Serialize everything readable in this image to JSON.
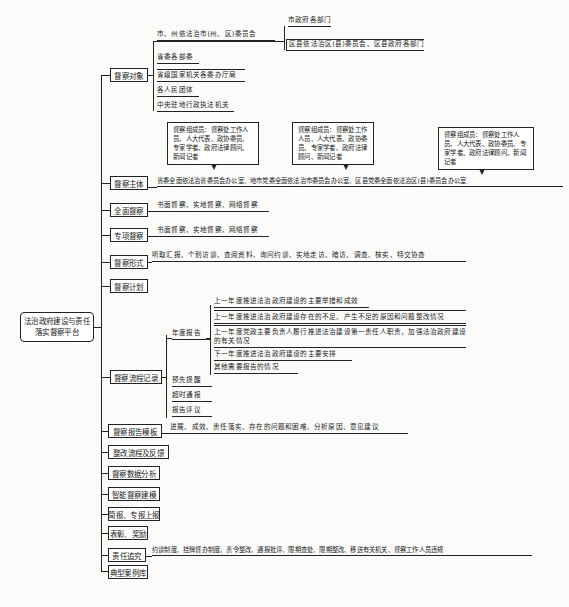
{
  "root": {
    "label": "法治政府建设与责任落实督察平台"
  },
  "branches": {
    "targets": {
      "label": "督察对象",
      "items": [
        {
          "label": "市、州依法治市(州、区)委员会",
          "children": [
            "市政府各部门",
            "区县依法治区(县)委员会、区县政府各部门"
          ]
        },
        {
          "label": "省委各部委"
        },
        {
          "label": "省级国家机关各委办厅局"
        },
        {
          "label": "各人民团体"
        },
        {
          "label": "中央驻地行政执法机关"
        }
      ]
    },
    "subject": {
      "label": "督察主体",
      "text": "省委全面依法治省委员会办公室、地市党委全面依法治市委员会办公室、区县党委全面依法治区(县)委员会办公室",
      "callouts": [
        "督察组成员：督察处工作人员、人大代表、政协委员、专家学者、政府法律顾问、新闻记者",
        "督察组成员：督察处工作人员、人大代表、政协委员、专家学者、政府法律顾问、新闻记者",
        "督察组成员：督察处工作人员、人大代表、政协委员、专家学者、政府法律顾问、新闻记者"
      ]
    },
    "full": {
      "label": "全面督察",
      "text": "书面督察、实地督察、网络督察"
    },
    "special": {
      "label": "专项督察",
      "text": "书面督察、实地督察、网络督察"
    },
    "form": {
      "label": "督察形式",
      "text": "听取汇报、个别访谈、查阅资料、询问约谈、实地走访、暗访、调查、核实、特交协查"
    },
    "plan": {
      "label": "督察计划"
    },
    "process": {
      "label": "督察流程记录",
      "annual": {
        "label": "年度报告",
        "items": [
          "上一年度推进法治政府建设的主要举措和成效",
          "上一年度推进法治政府建设存在的不足、产生不足的原因和问题整改情况",
          "上一年度党政主要负责人履行推进法治建设第一责任人职责，加强法治政府建设的有关情况",
          "下一年度推进法治政府建设的主要安排",
          "其他需要报告的情况"
        ]
      },
      "others": [
        "预先提醒",
        "超时通报",
        "报告评议"
      ]
    },
    "template": {
      "label": "督察报告模板",
      "text": "进展、成效、责任落实、存在的问题和困难、分析原因、意见建议"
    },
    "rectify": {
      "label": "整改流程及反馈"
    },
    "analysis": {
      "label": "督察数据分析"
    },
    "smart": {
      "label": "智能督察建模"
    },
    "brief": {
      "label": "简报、专报上报"
    },
    "reward": {
      "label": "表彰、奖励"
    },
    "accountability": {
      "label": "责任追究",
      "text": "约谈制度、挂牌督办制度、责令整改、通报批评、限期查处、限期整改、移送有关机关、督察工作人员违规"
    },
    "cases": {
      "label": "典型案例库"
    }
  }
}
